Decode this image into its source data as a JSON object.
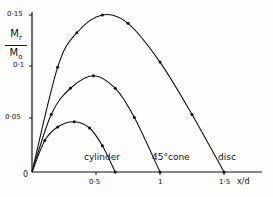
{
  "chart_data": {
    "type": "line",
    "title": "",
    "xlabel": "x/d",
    "ylabel": "Mr/Mo",
    "xlim": [
      0,
      1.6
    ],
    "ylim": [
      0,
      0.155
    ],
    "grid": false,
    "legend": "inline labels near curves",
    "x_ticks": [
      "0.5",
      "1",
      "1.5"
    ],
    "y_ticks": [
      "0.05",
      "0.1",
      "0.15"
    ],
    "origin_label": "0",
    "series": [
      {
        "name": "cylinder",
        "x": [
          0,
          0.1,
          0.2,
          0.33,
          0.45,
          0.55,
          0.65
        ],
        "y": [
          0,
          0.03,
          0.043,
          0.048,
          0.042,
          0.025,
          0
        ]
      },
      {
        "name": "45° cone",
        "x": [
          0,
          0.15,
          0.3,
          0.48,
          0.65,
          0.8,
          1.0
        ],
        "y": [
          0,
          0.055,
          0.08,
          0.092,
          0.08,
          0.052,
          0
        ]
      },
      {
        "name": "disc",
        "x": [
          0,
          0.2,
          0.35,
          0.55,
          0.75,
          1.0,
          1.25,
          1.5
        ],
        "y": [
          0,
          0.1,
          0.133,
          0.15,
          0.142,
          0.105,
          0.055,
          0
        ]
      }
    ]
  },
  "labels": {
    "ylabel_num": "M",
    "ylabel_num_sub": "r",
    "ylabel_den": "M",
    "ylabel_den_sub": "o",
    "xlabel": "x/d",
    "origin": "0",
    "ytick_015": "0·15",
    "ytick_01": "0·1",
    "ytick_005": "0·05",
    "xtick_05": "0·5",
    "xtick_1": "1",
    "xtick_15": "1·5",
    "cylinder": "cylinder",
    "cone": "45°cone",
    "disc": "disc"
  }
}
